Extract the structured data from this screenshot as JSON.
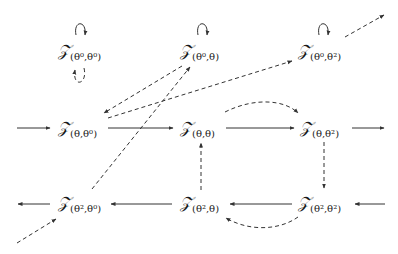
{
  "diagram": {
    "nodes": [
      {
        "id": "t00",
        "symbol": "𝒵",
        "subscript": "(θ⁰,θ⁰)"
      },
      {
        "id": "t0t",
        "symbol": "𝒵",
        "subscript": "(θ⁰,θ)"
      },
      {
        "id": "t02",
        "symbol": "𝒵",
        "subscript": "(θ⁰,θ²)"
      },
      {
        "id": "tt0",
        "symbol": "𝒵",
        "subscript": "(θ,θ⁰)"
      },
      {
        "id": "ttt",
        "symbol": "𝒵",
        "subscript": "(θ,θ)"
      },
      {
        "id": "tt2",
        "symbol": "𝒵",
        "subscript": "(θ,θ²)"
      },
      {
        "id": "t20",
        "symbol": "𝒵",
        "subscript": "(θ²,θ⁰)"
      },
      {
        "id": "t2t",
        "symbol": "𝒵",
        "subscript": "(θ²,θ)"
      },
      {
        "id": "t22",
        "symbol": "𝒵",
        "subscript": "(θ²,θ²)"
      }
    ],
    "edges": [
      {
        "from": "external-left",
        "to": "tt0",
        "style": "solid"
      },
      {
        "from": "tt0",
        "to": "ttt",
        "style": "solid"
      },
      {
        "from": "ttt",
        "to": "tt2",
        "style": "solid"
      },
      {
        "from": "tt2",
        "to": "external-right",
        "style": "solid"
      },
      {
        "from": "external-right",
        "to": "t22",
        "style": "solid"
      },
      {
        "from": "t22",
        "to": "t2t",
        "style": "solid"
      },
      {
        "from": "t2t",
        "to": "t20",
        "style": "solid"
      },
      {
        "from": "t20",
        "to": "external-left",
        "style": "solid"
      },
      {
        "from": "t00",
        "to": "t00",
        "style": "solid-loop"
      },
      {
        "from": "t0t",
        "to": "t0t",
        "style": "solid-loop"
      },
      {
        "from": "t02",
        "to": "t02",
        "style": "solid-loop"
      },
      {
        "from": "t00",
        "to": "t00",
        "style": "dashed-loop"
      },
      {
        "from": "t0t",
        "to": "tt0",
        "style": "dashed"
      },
      {
        "from": "tt0",
        "to": "t02",
        "style": "dashed"
      },
      {
        "from": "t02",
        "to": "external-top-right",
        "style": "dashed"
      },
      {
        "from": "t20",
        "to": "t0t",
        "style": "dashed"
      },
      {
        "from": "external-bottom-left",
        "to": "t20",
        "style": "dashed"
      },
      {
        "from": "ttt",
        "to": "tt2",
        "style": "dashed-curve"
      },
      {
        "from": "tt2",
        "to": "t22",
        "style": "dashed"
      },
      {
        "from": "t2t",
        "to": "ttt",
        "style": "dashed"
      },
      {
        "from": "t22",
        "to": "t2t",
        "style": "dashed-curve"
      }
    ]
  }
}
